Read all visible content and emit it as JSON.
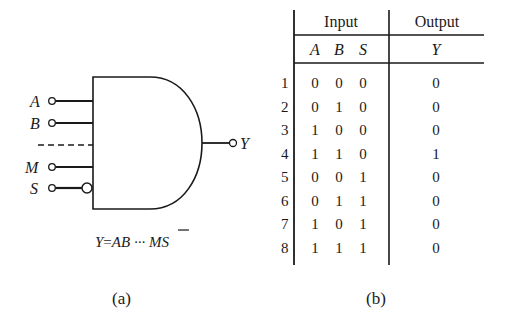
{
  "figure_a": {
    "caption": "(a)",
    "gate_type": "AND",
    "inputs": [
      {
        "label": "A",
        "inverted": false
      },
      {
        "label": "B",
        "inverted": false
      },
      {
        "label": "M",
        "inverted": false
      },
      {
        "label": "S",
        "inverted": true
      }
    ],
    "ellipsis": "- - - -",
    "output": {
      "label": "Y"
    },
    "equation": {
      "lhs": "Y",
      "eq": "=",
      "terms": "AB ··· M",
      "negated": "S"
    }
  },
  "figure_b": {
    "caption": "(b)",
    "group_headers": {
      "input": "Input",
      "output": "Output"
    },
    "columns": [
      "A",
      "B",
      "S",
      "Y"
    ],
    "rows": [
      {
        "n": "1",
        "A": "0",
        "B": "0",
        "S": "0",
        "Y": "0"
      },
      {
        "n": "2",
        "A": "0",
        "B": "1",
        "S": "0",
        "Y": "0"
      },
      {
        "n": "3",
        "A": "1",
        "B": "0",
        "S": "0",
        "Y": "0"
      },
      {
        "n": "4",
        "A": "1",
        "B": "1",
        "S": "0",
        "Y": "1"
      },
      {
        "n": "5",
        "A": "0",
        "B": "0",
        "S": "1",
        "Y": "0"
      },
      {
        "n": "6",
        "A": "0",
        "B": "1",
        "S": "1",
        "Y": "0"
      },
      {
        "n": "7",
        "A": "1",
        "B": "0",
        "S": "1",
        "Y": "0"
      },
      {
        "n": "8",
        "A": "1",
        "B": "1",
        "S": "1",
        "Y": "0"
      }
    ]
  }
}
